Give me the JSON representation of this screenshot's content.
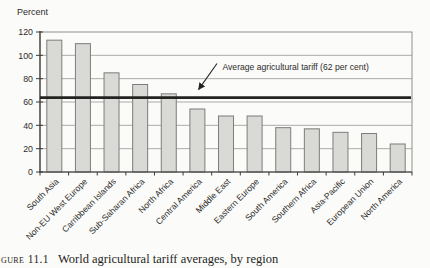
{
  "figure": {
    "caption_label": "gure 11.1",
    "caption_text": "World agricultural tariff averages, by region"
  },
  "chart_data": {
    "type": "bar",
    "title": "",
    "ylabel": "Percent",
    "xlabel": "",
    "categories": [
      "South Asia",
      "Non-EU West Europe",
      "Carribbean Islands",
      "Sub-Saharan Africa",
      "North Africa",
      "Central America",
      "Middle East",
      "Eastern Europe",
      "South America",
      "Southern Africa",
      "Asia-Pacific",
      "European Union",
      "North America"
    ],
    "values": [
      113,
      110,
      85,
      75,
      67,
      54,
      48,
      48,
      38,
      37,
      34,
      33,
      24
    ],
    "ylim": [
      0,
      120
    ],
    "yticks": [
      0,
      20,
      40,
      60,
      80,
      100,
      120
    ],
    "grid": true,
    "legend": false,
    "annotation": {
      "text": "Average agricultural tariff (62 per cent)",
      "value": 62
    },
    "colors": {
      "bar_fill": "#d9d9d5",
      "bar_border": "#7d7d7a",
      "grid": "#a3a3a0",
      "axis": "#3a3a38",
      "box": "#84847f",
      "average_line": "#232321",
      "text": "#2c2c2a"
    }
  }
}
